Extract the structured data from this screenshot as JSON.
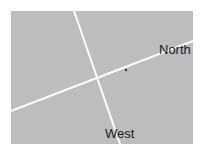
{
  "diagram": {
    "background_color": "#ffffff",
    "panel": {
      "x": 11,
      "y": 11,
      "width": 182,
      "height": 133,
      "fill": "#bdbdbd"
    },
    "lines": [
      {
        "name": "north-street",
        "label": "North",
        "x1": 11,
        "y1": 111,
        "x2": 193,
        "y2": 41,
        "color": "#ffffff",
        "width": 2
      },
      {
        "name": "west-street",
        "label": "West",
        "x1": 74,
        "y1": 11,
        "x2": 120,
        "y2": 144,
        "color": "#ffffff",
        "width": 2
      }
    ],
    "intersection": {
      "x": 98,
      "y": 78
    },
    "marker": {
      "x": 126,
      "y": 70,
      "color": "#333333"
    },
    "labels": {
      "north": "North",
      "west": "West"
    }
  }
}
